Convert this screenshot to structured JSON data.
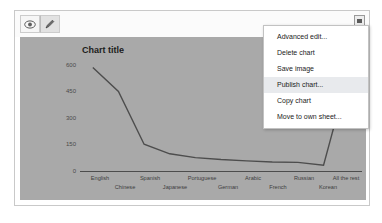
{
  "toolbar": {
    "view_button": "eye-icon",
    "edit_button": "pencil-icon",
    "menu_button": "dropdown-icon"
  },
  "context_menu": {
    "items": [
      {
        "label": "Advanced edit...",
        "active": false
      },
      {
        "label": "Delete chart",
        "active": false
      },
      {
        "label": "Save image",
        "active": false
      },
      {
        "label": "Publish chart...",
        "active": true
      },
      {
        "label": "Copy chart",
        "active": false
      },
      {
        "label": "Move to own sheet...",
        "active": false
      }
    ]
  },
  "chart_data": {
    "type": "line",
    "title": "Chart title",
    "xlabel": "",
    "ylabel": "",
    "ylim": [
      0,
      600
    ],
    "yticks": [
      600,
      450,
      300,
      150,
      0
    ],
    "ytick_labels": [
      "600",
      "450",
      "300",
      "150",
      "0"
    ],
    "grid": true,
    "legend": "none",
    "categories": [
      "English",
      "Chinese",
      "Spanish",
      "Japanese",
      "Portuguese",
      "German",
      "Arabic",
      "French",
      "Russian",
      "Korean",
      "All the rest"
    ],
    "series": [
      {
        "name": "Series 1",
        "values": [
          545,
          420,
          145,
          95,
          75,
          65,
          58,
          52,
          50,
          35,
          530
        ]
      }
    ],
    "line_color": "#4d4d4d",
    "plot_background": "#a9a9a9"
  }
}
